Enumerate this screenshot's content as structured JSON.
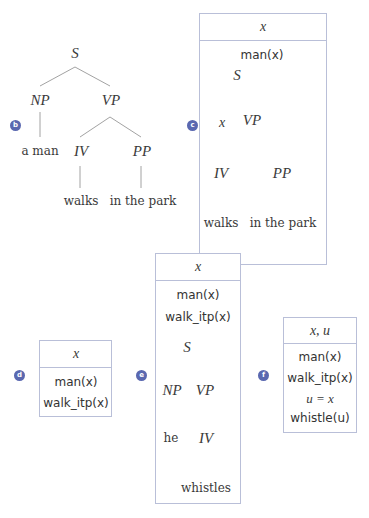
{
  "colors": {
    "badge": "#5a68b0",
    "box_border": "#b9bfd8",
    "tree_line": "#8a8a8a"
  },
  "panels": {
    "b": {
      "badge": "b",
      "tree": {
        "S": "S",
        "NP": "NP",
        "VP": "VP",
        "IV": "IV",
        "PP": "PP",
        "np_leaf": "a man",
        "iv_leaf": "walks",
        "pp_leaf": "in the park"
      }
    },
    "c": {
      "badge": "c",
      "universe": "x",
      "conditions": [
        "man(x)"
      ],
      "tree": {
        "S": "S",
        "subj": "x",
        "VP": "VP",
        "IV": "IV",
        "PP": "PP",
        "iv_leaf": "walks",
        "pp_leaf": "in the park"
      }
    },
    "d": {
      "badge": "d",
      "universe": "x",
      "conditions": [
        "man(x)",
        "walk_itp(x)"
      ]
    },
    "e": {
      "badge": "e",
      "universe": "x",
      "conditions": [
        "man(x)",
        "walk_itp(x)"
      ],
      "tree": {
        "S": "S",
        "NP": "NP",
        "VP": "VP",
        "np_leaf": "he",
        "IV": "IV",
        "iv_leaf": "whistles"
      }
    },
    "f": {
      "badge": "f",
      "universe": "x, u",
      "conditions": [
        "man(x)",
        "walk_itp(x)",
        "u = x",
        "whistle(u)"
      ]
    }
  }
}
